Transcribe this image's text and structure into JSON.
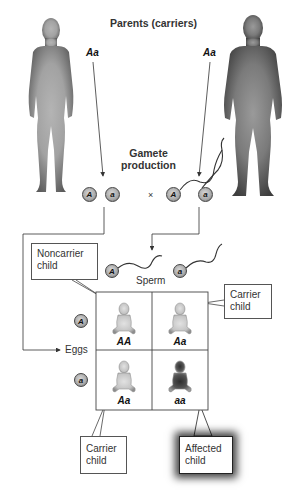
{
  "diagram": {
    "title": "Parents (carriers)",
    "parents": [
      {
        "name": "mother",
        "genotype": "Aa",
        "figure_color": "#8a8a8a"
      },
      {
        "name": "father",
        "genotype": "Aa",
        "figure_color": "#5a5a5a"
      }
    ],
    "gamete_production": {
      "line1": "Gamete",
      "line2": "production",
      "cross_symbol": "×",
      "eggs": [
        "A",
        "a"
      ],
      "sperm": [
        "A",
        "a"
      ]
    },
    "punnett": {
      "sperm_label": "Sperm",
      "eggs_label": "Eggs",
      "sperm_alleles": [
        "A",
        "a"
      ],
      "egg_alleles": [
        "A",
        "a"
      ],
      "cells": [
        {
          "genotype": "AA",
          "phenotype": "noncarrier"
        },
        {
          "genotype": "Aa",
          "phenotype": "carrier"
        },
        {
          "genotype": "Aa",
          "phenotype": "carrier"
        },
        {
          "genotype": "aa",
          "phenotype": "affected"
        }
      ]
    },
    "callouts": {
      "noncarrier": {
        "line1": "Noncarrier",
        "line2": "child"
      },
      "carrier_top": {
        "line1": "Carrier",
        "line2": "child"
      },
      "carrier_bottom": {
        "line1": "Carrier",
        "line2": "child"
      },
      "affected": {
        "line1": "Affected",
        "line2": "child"
      }
    }
  }
}
